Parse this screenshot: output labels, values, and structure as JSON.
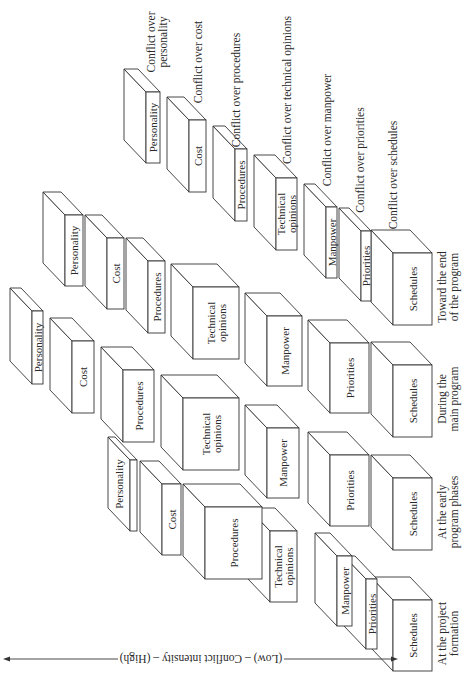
{
  "axis": {
    "label": "(Low) – Conflict intensity – (High)",
    "orientation": "double-headed arrow, rotated text"
  },
  "conflict_legend": [
    "Conflict over personality",
    "Conflict over cost",
    "Conflict over procedures",
    "Conflict over technical opinions",
    "Conflict over manpower",
    "Conflict over priorities",
    "Conflict over schedules"
  ],
  "categories": [
    "Personality",
    "Cost",
    "Procedures",
    "Technical opinions",
    "Manpower",
    "Priorities",
    "Schedules"
  ],
  "phases": [
    {
      "name": "Toward the end of the program",
      "caption_lines": [
        "Toward the end",
        "of the program"
      ],
      "boxes": [
        {
          "label": "Personality",
          "x1": 146,
          "x2": 160,
          "y1": 92,
          "y2": 163
        },
        {
          "label": "Cost",
          "x1": 189,
          "x2": 206,
          "y1": 120,
          "y2": 192
        },
        {
          "label": "Procedures",
          "x1": 235,
          "x2": 247,
          "y1": 149,
          "y2": 221
        },
        {
          "label": "Technical opinions",
          "x1": 276,
          "x2": 297,
          "y1": 178,
          "y2": 250
        },
        {
          "label": "Manpower",
          "x1": 326,
          "x2": 337,
          "y1": 207,
          "y2": 278
        },
        {
          "label": "Priorities",
          "x1": 361,
          "x2": 371,
          "y1": 231,
          "y2": 301
        },
        {
          "label": "Schedules",
          "x1": 393,
          "x2": 432,
          "y1": 253,
          "y2": 325
        }
      ]
    },
    {
      "name": "During the main program",
      "caption_lines": [
        "During the",
        "main program"
      ],
      "boxes": [
        {
          "label": "Personality",
          "x1": 65,
          "x2": 83,
          "y1": 215,
          "y2": 286
        },
        {
          "label": "Cost",
          "x1": 107,
          "x2": 124,
          "y1": 238,
          "y2": 309
        },
        {
          "label": "Procedures",
          "x1": 148,
          "x2": 165,
          "y1": 261,
          "y2": 333
        },
        {
          "label": "Technical opinions",
          "x1": 193,
          "x2": 239,
          "y1": 287,
          "y2": 359
        },
        {
          "label": "Manpower",
          "x1": 267,
          "x2": 302,
          "y1": 316,
          "y2": 386
        },
        {
          "label": "Priorities",
          "x1": 330,
          "x2": 369,
          "y1": 343,
          "y2": 413
        },
        {
          "label": "Schedules",
          "x1": 393,
          "x2": 432,
          "y1": 365,
          "y2": 437
        }
      ]
    },
    {
      "name": "At the early program phases",
      "caption_lines": [
        "At the early",
        "program phases"
      ],
      "boxes": [
        {
          "label": "Personality",
          "x1": 32,
          "x2": 43,
          "y1": 311,
          "y2": 384
        },
        {
          "label": "Cost",
          "x1": 72,
          "x2": 94,
          "y1": 341,
          "y2": 413
        },
        {
          "label": "Procedures",
          "x1": 123,
          "x2": 154,
          "y1": 370,
          "y2": 442
        },
        {
          "label": "Technical opinions",
          "x1": 183,
          "x2": 239,
          "y1": 398,
          "y2": 470
        },
        {
          "label": "Manpower",
          "x1": 267,
          "x2": 299,
          "y1": 428,
          "y2": 498
        },
        {
          "label": "Priorities",
          "x1": 330,
          "x2": 369,
          "y1": 455,
          "y2": 526
        },
        {
          "label": "Schedules",
          "x1": 393,
          "x2": 432,
          "y1": 478,
          "y2": 550
        }
      ]
    },
    {
      "name": "At the project formation",
      "caption_lines": [
        "At the project",
        "formation"
      ],
      "boxes": [
        {
          "label": "Personality",
          "x1": 130,
          "x2": 137,
          "y1": 460,
          "y2": 531
        },
        {
          "label": "Cost",
          "x1": 162,
          "x2": 181,
          "y1": 484,
          "y2": 555
        },
        {
          "label": "Procedures",
          "x1": 205,
          "x2": 262,
          "y1": 507,
          "y2": 579
        },
        {
          "label": "Technical opinions",
          "x1": 270,
          "x2": 297,
          "y1": 531,
          "y2": 602
        },
        {
          "label": "Manpower",
          "x1": 337,
          "x2": 352,
          "y1": 556,
          "y2": 626
        },
        {
          "label": "Priorities",
          "x1": 366,
          "x2": 377,
          "y1": 579,
          "y2": 649
        },
        {
          "label": "Schedules",
          "x1": 393,
          "x2": 432,
          "y1": 600,
          "y2": 671
        }
      ]
    }
  ],
  "depth": {
    "dx": -22,
    "dy": -23
  }
}
